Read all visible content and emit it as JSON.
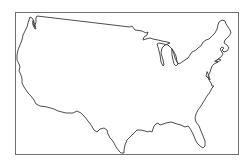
{
  "map": {
    "subject": "Contiguous United States outline",
    "style": "blank outline map",
    "colors": {
      "background": "#ffffff",
      "frame": "#6f6f6f",
      "outline": "#3a3a3a"
    }
  }
}
